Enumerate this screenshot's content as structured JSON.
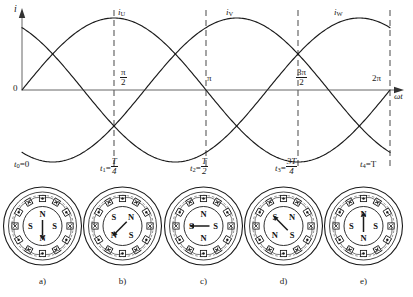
{
  "figure": {
    "axis": {
      "y_label": "i",
      "x_label": "ωt",
      "origin_label": "0"
    },
    "phase_labels": [
      {
        "name": "i_U",
        "base": "i",
        "sub": "U",
        "x": 118,
        "y": 8
      },
      {
        "name": "i_V",
        "base": "i",
        "sub": "V",
        "x": 226,
        "y": 8
      },
      {
        "name": "i_W",
        "base": "i",
        "sub": "W",
        "x": 334,
        "y": 8
      }
    ],
    "angle_ticks": [
      {
        "label": "π/2",
        "num": "π",
        "den": "2",
        "omega_t": 1.5707963,
        "x": 120,
        "y": 68
      },
      {
        "label": "π",
        "num": "",
        "den": "",
        "omega_t": 3.1415927,
        "x": 207,
        "y": 74
      },
      {
        "label": "3π/2",
        "num": "3π",
        "den": "2",
        "omega_t": 4.712389,
        "x": 296,
        "y": 68
      },
      {
        "label": "2π",
        "num": "",
        "den": "",
        "omega_t": 6.2831853,
        "x": 372,
        "y": 74
      }
    ],
    "time_marks": [
      {
        "name": "t0",
        "base": "t",
        "sub": "0",
        "rel": "=0",
        "num": "",
        "den": "",
        "x": 14,
        "y": 160
      },
      {
        "name": "t1",
        "base": "t",
        "sub": "1",
        "rel": "=",
        "num": "T",
        "den": "4",
        "x": 100,
        "y": 157
      },
      {
        "name": "t2",
        "base": "t",
        "sub": "2",
        "rel": "=",
        "num": "T",
        "den": "2",
        "x": 190,
        "y": 157
      },
      {
        "name": "t3",
        "base": "t",
        "sub": "3",
        "rel": "=",
        "num": "3T",
        "den": "4",
        "x": 275,
        "y": 157
      },
      {
        "name": "t4",
        "base": "t",
        "sub": "4",
        "rel": "=T",
        "num": "",
        "den": "",
        "x": 360,
        "y": 160
      }
    ],
    "subcaptions": [
      "a)",
      "b)",
      "c)",
      "d)",
      "e)"
    ]
  },
  "chart_data": {
    "type": "line",
    "title": "",
    "xlabel": "ωt",
    "ylabel": "i",
    "xlim": [
      0,
      6.2831853
    ],
    "ylim": [
      -1,
      1
    ],
    "grid": false,
    "legend": "inline-curve-labels",
    "x_tick_labels": [
      "0",
      "π/2",
      "π",
      "3π/2",
      "2π"
    ],
    "x_ticks": [
      0,
      1.5707963,
      3.1415927,
      4.712389,
      6.2831853
    ],
    "dashed_verticals": [
      1.5707963,
      3.1415927,
      4.712389,
      6.2831853
    ],
    "series": [
      {
        "name": "i_U",
        "form": "sin(wt)",
        "amplitude": 1,
        "phase_deg": 0,
        "values": [
          0,
          0.5,
          0.866,
          1,
          0.866,
          0.5,
          0,
          -0.5,
          -0.866,
          -1,
          -0.866,
          -0.5,
          0
        ]
      },
      {
        "name": "i_V",
        "form": "sin(wt - 120deg)",
        "amplitude": 1,
        "phase_deg": -120,
        "values": [
          -0.866,
          -1,
          -0.866,
          -0.5,
          0,
          0.5,
          0.866,
          1,
          0.866,
          0.5,
          0,
          -0.5,
          -0.866
        ]
      },
      {
        "name": "i_W",
        "form": "sin(wt + 120deg)",
        "amplitude": 1,
        "phase_deg": 120,
        "values": [
          0.866,
          0.5,
          0,
          -0.5,
          -0.866,
          -1,
          -0.866,
          -0.5,
          0,
          0.5,
          0.866,
          1,
          0.866
        ]
      }
    ],
    "sample_wt": [
      0,
      0.5236,
      1.0472,
      1.5708,
      2.0944,
      2.618,
      3.1416,
      3.6652,
      4.1888,
      4.7124,
      5.236,
      5.7596,
      6.2832
    ]
  },
  "rotor_diagrams": [
    {
      "caption": "a)",
      "time": "t0=0",
      "field_angle_deg": 0,
      "arrow_direction": "down",
      "slots": 12,
      "poles": [
        {
          "label": "N",
          "position": "top"
        },
        {
          "label": "S",
          "position": "right"
        },
        {
          "label": "N",
          "position": "bottom"
        },
        {
          "label": "S",
          "position": "left"
        }
      ]
    },
    {
      "caption": "b)",
      "time": "t1=T/4",
      "field_angle_deg": 45,
      "arrow_direction": "up-right",
      "slots": 12,
      "poles": [
        {
          "label": "N",
          "position": "upper-right"
        },
        {
          "label": "S",
          "position": "lower-right"
        },
        {
          "label": "N",
          "position": "lower-left"
        },
        {
          "label": "S",
          "position": "upper-left"
        }
      ]
    },
    {
      "caption": "c)",
      "time": "t2=T/2",
      "field_angle_deg": 90,
      "arrow_direction": "right",
      "slots": 12,
      "poles": [
        {
          "label": "S",
          "position": "top"
        },
        {
          "label": "N",
          "position": "right"
        },
        {
          "label": "S",
          "position": "bottom"
        },
        {
          "label": "N",
          "position": "left"
        }
      ]
    },
    {
      "caption": "d)",
      "time": "t3=3T/4",
      "field_angle_deg": 135,
      "arrow_direction": "down-right",
      "slots": 12,
      "poles": [
        {
          "label": "S",
          "position": "upper-right"
        },
        {
          "label": "N",
          "position": "lower-right"
        },
        {
          "label": "S",
          "position": "lower-left"
        },
        {
          "label": "N",
          "position": "upper-left"
        }
      ]
    },
    {
      "caption": "e)",
      "time": "t4=T",
      "field_angle_deg": 180,
      "arrow_direction": "down",
      "slots": 12,
      "poles": [
        {
          "label": "N",
          "position": "top"
        },
        {
          "label": "S",
          "position": "right"
        },
        {
          "label": "N",
          "position": "bottom"
        },
        {
          "label": "S",
          "position": "left"
        }
      ]
    }
  ]
}
